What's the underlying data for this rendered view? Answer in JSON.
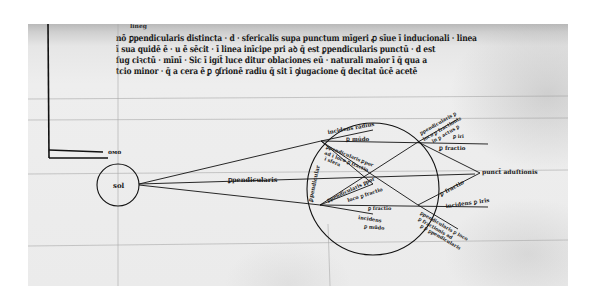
{
  "document": {
    "type": "medieval manuscript folio",
    "subject": "optics diagram — rays from the sun passing through a sphere",
    "colors": {
      "parchment": "#ebebeb",
      "ink": "#1a1a1a",
      "background": "#ffffff"
    }
  },
  "text": {
    "gloss": "lineg",
    "lines": [
      "nō ꝑpendicularis distincta · d · sfericalis supa punctum mīgeri ꝓ sīue ī inducionali · linea",
      "ī sua quidē ē · u ē sēcit · ī linea inīcipe pri aꝺ q̄ est ꝑpendicularis punctū · d est",
      "ſug ciꝛctū · mīnī · Sic ī igi̇t̄ luce ditur oblaciones eū · naturali maior ī q̄ qua a",
      "tcio minor · q̄ a cera ē ꝑ ꝯſrionē radiu q̄ sit ī ꝯiugacione q̄ decitat ūcē acetē"
    ]
  },
  "diagram": {
    "sun_label": "sol",
    "upper_margin_label": "oᴍo",
    "center_ray_label": "ꝑpendicularis",
    "sphere_left_label": "ꝑpendicular",
    "upper_inner_labels": [
      "incidens radius",
      "ꝑ mūdo"
    ],
    "upper_left_block": [
      "ꝑpendicularis ꝑpor",
      "ad ī loco ꝑ fractio",
      "ī sfera"
    ],
    "lower_left_block": [
      "ꝑpendicularis ꝑpor",
      "loco ꝑ fractio"
    ],
    "lower_inner_labels": [
      "ꝑ fractio",
      "incidens",
      "ꝑ mūdo"
    ],
    "upper_right_block": [
      "ꝑpendicularis ꝑ",
      "loco ꝑ fractionis",
      "in ꝑ actus ꝑ",
      "ꝑ iri"
    ],
    "upper_right_short": "ꝑ fractio",
    "focal_label": "punct̄ aduſtionis",
    "lower_right_short": "ꝑ fractio",
    "lower_right_incidens": "incidens ꝑ iris",
    "lower_right_block": [
      "ꝑpendicularis ꝑ loco",
      "ꝑ fractionis ad",
      "ꝑ ꝑ ꝑpendicularis"
    ]
  }
}
